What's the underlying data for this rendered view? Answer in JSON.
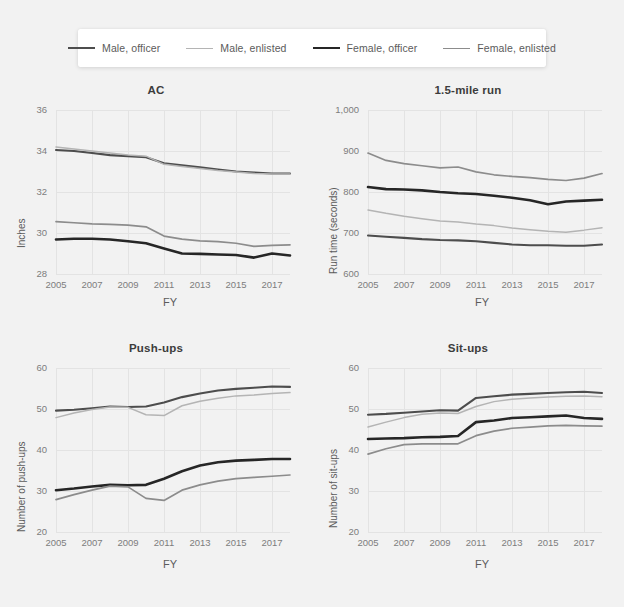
{
  "legend": {
    "entries": [
      {
        "label": "Male, officer",
        "color": "#4d4d4d",
        "width": 2.1,
        "key": "male_officer"
      },
      {
        "label": "Male, enlisted",
        "color": "#b4b4b4",
        "width": 1.5,
        "key": "male_enlisted"
      },
      {
        "label": "Female, officer",
        "color": "#262626",
        "width": 2.6,
        "key": "female_officer"
      },
      {
        "label": "Female, enlisted",
        "color": "#8c8c8c",
        "width": 1.7,
        "key": "female_enlisted"
      }
    ]
  },
  "chart_data": [
    {
      "id": "ac",
      "type": "line",
      "title": "AC",
      "xlabel": "FY",
      "ylabel": "Inches",
      "x": [
        2005,
        2006,
        2007,
        2008,
        2009,
        2010,
        2011,
        2012,
        2013,
        2014,
        2015,
        2016,
        2017,
        2018
      ],
      "xlim": [
        2005,
        2018
      ],
      "xticks": [
        2005,
        2007,
        2009,
        2011,
        2013,
        2015,
        2017
      ],
      "xticklabels": [
        "2005",
        "2007",
        "2009",
        "2011",
        "2013",
        "2015",
        "2017"
      ],
      "ylim": [
        28,
        36
      ],
      "yticks": [
        28,
        30,
        32,
        34,
        36
      ],
      "yticklabels": [
        "28",
        "30",
        "32",
        "34",
        "36"
      ],
      "grid": true,
      "series": [
        {
          "name": "Male, officer",
          "key": "male_officer",
          "values": [
            34.05,
            34.0,
            33.9,
            33.8,
            33.75,
            33.7,
            33.4,
            33.3,
            33.2,
            33.1,
            33.0,
            32.95,
            32.9,
            32.9
          ]
        },
        {
          "name": "Male, enlisted",
          "key": "male_enlisted",
          "values": [
            34.2,
            34.1,
            34.0,
            33.9,
            33.8,
            33.75,
            33.35,
            33.25,
            33.15,
            33.05,
            32.98,
            32.9,
            32.88,
            32.88
          ]
        },
        {
          "name": "Female, officer",
          "key": "female_officer",
          "values": [
            29.68,
            29.72,
            29.72,
            29.68,
            29.6,
            29.5,
            29.25,
            29.0,
            28.98,
            28.95,
            28.93,
            28.8,
            29.0,
            28.9
          ]
        },
        {
          "name": "Female, enlisted",
          "key": "female_enlisted",
          "values": [
            30.55,
            30.5,
            30.45,
            30.42,
            30.38,
            30.3,
            29.85,
            29.7,
            29.62,
            29.58,
            29.5,
            29.35,
            29.4,
            29.42
          ]
        }
      ]
    },
    {
      "id": "run",
      "type": "line",
      "title": "1.5-mile run",
      "xlabel": "FY",
      "ylabel": "Run time (seconds)",
      "x": [
        2005,
        2006,
        2007,
        2008,
        2009,
        2010,
        2011,
        2012,
        2013,
        2014,
        2015,
        2016,
        2017,
        2018
      ],
      "xlim": [
        2005,
        2018
      ],
      "xticks": [
        2005,
        2007,
        2009,
        2011,
        2013,
        2015,
        2017
      ],
      "xticklabels": [
        "2005",
        "2007",
        "2009",
        "2011",
        "2013",
        "2015",
        "2017"
      ],
      "ylim": [
        600,
        1000
      ],
      "yticks": [
        600,
        700,
        800,
        900,
        1000
      ],
      "yticklabels": [
        "600",
        "700",
        "800",
        "900",
        "1,000"
      ],
      "grid": true,
      "series": [
        {
          "name": "Male, officer",
          "key": "male_officer",
          "values": [
            694,
            691,
            688,
            685,
            683,
            682,
            680,
            676,
            672,
            670,
            670,
            669,
            669,
            672
          ]
        },
        {
          "name": "Male, enlisted",
          "key": "male_enlisted",
          "values": [
            756,
            748,
            741,
            735,
            729,
            727,
            722,
            718,
            712,
            708,
            704,
            702,
            707,
            713
          ]
        },
        {
          "name": "Female, officer",
          "key": "female_officer",
          "values": [
            812,
            807,
            806,
            804,
            800,
            797,
            795,
            791,
            786,
            780,
            770,
            777,
            779,
            781
          ]
        },
        {
          "name": "Female, enlisted",
          "key": "female_enlisted",
          "values": [
            895,
            877,
            869,
            864,
            859,
            861,
            849,
            842,
            838,
            835,
            831,
            828,
            834,
            845
          ]
        }
      ]
    },
    {
      "id": "pushups",
      "type": "line",
      "title": "Push-ups",
      "xlabel": "FY",
      "ylabel": "Number of push-ups",
      "x": [
        2005,
        2006,
        2007,
        2008,
        2009,
        2010,
        2011,
        2012,
        2013,
        2014,
        2015,
        2016,
        2017,
        2018
      ],
      "xlim": [
        2005,
        2018
      ],
      "xticks": [
        2005,
        2007,
        2009,
        2011,
        2013,
        2015,
        2017
      ],
      "xticklabels": [
        "2005",
        "2007",
        "2009",
        "2011",
        "2013",
        "2015",
        "2017"
      ],
      "ylim": [
        20,
        60
      ],
      "yticks": [
        20,
        30,
        40,
        50,
        60
      ],
      "yticklabels": [
        "20",
        "30",
        "40",
        "50",
        "60"
      ],
      "grid": true,
      "series": [
        {
          "name": "Male, officer",
          "key": "male_officer",
          "values": [
            49.6,
            49.8,
            50.2,
            50.6,
            50.5,
            50.6,
            51.6,
            52.9,
            53.8,
            54.5,
            54.9,
            55.2,
            55.5,
            55.4
          ]
        },
        {
          "name": "Male, enlisted",
          "key": "male_enlisted",
          "values": [
            47.9,
            49.0,
            49.9,
            50.5,
            50.4,
            48.6,
            48.4,
            50.8,
            51.9,
            52.6,
            53.2,
            53.4,
            53.8,
            54.0
          ]
        },
        {
          "name": "Female, officer",
          "key": "female_officer",
          "values": [
            30.2,
            30.6,
            31.1,
            31.5,
            31.4,
            31.5,
            33.0,
            34.8,
            36.2,
            37.0,
            37.4,
            37.6,
            37.8,
            37.8
          ]
        },
        {
          "name": "Female, enlisted",
          "key": "female_enlisted",
          "values": [
            27.9,
            29.1,
            30.2,
            31.2,
            31.0,
            28.2,
            27.7,
            30.2,
            31.5,
            32.4,
            33.0,
            33.3,
            33.6,
            33.9
          ]
        }
      ]
    },
    {
      "id": "situps",
      "type": "line",
      "title": "Sit-ups",
      "xlabel": "FY",
      "ylabel": "Number of sit-ups",
      "x": [
        2005,
        2006,
        2007,
        2008,
        2009,
        2010,
        2011,
        2012,
        2013,
        2014,
        2015,
        2016,
        2017,
        2018
      ],
      "xlim": [
        2005,
        2018
      ],
      "xticks": [
        2005,
        2007,
        2009,
        2011,
        2013,
        2015,
        2017
      ],
      "xticklabels": [
        "2005",
        "2007",
        "2009",
        "2011",
        "2013",
        "2015",
        "2017"
      ],
      "ylim": [
        20,
        60
      ],
      "yticks": [
        20,
        30,
        40,
        50,
        60
      ],
      "yticklabels": [
        "20",
        "30",
        "40",
        "50",
        "60"
      ],
      "grid": true,
      "series": [
        {
          "name": "Male, officer",
          "key": "male_officer",
          "values": [
            48.6,
            48.8,
            49.1,
            49.4,
            49.7,
            49.6,
            52.7,
            53.1,
            53.5,
            53.7,
            53.9,
            54.1,
            54.2,
            53.9
          ]
        },
        {
          "name": "Male, enlisted",
          "key": "male_enlisted",
          "values": [
            45.6,
            46.8,
            47.9,
            48.7,
            49.0,
            48.9,
            50.6,
            51.8,
            52.4,
            52.7,
            52.9,
            53.1,
            53.2,
            53.0
          ]
        },
        {
          "name": "Female, officer",
          "key": "female_officer",
          "values": [
            42.7,
            42.8,
            42.9,
            43.1,
            43.2,
            43.4,
            46.8,
            47.2,
            47.8,
            48.0,
            48.2,
            48.4,
            47.8,
            47.6
          ]
        },
        {
          "name": "Female, enlisted",
          "key": "female_enlisted",
          "values": [
            39.0,
            40.3,
            41.3,
            41.5,
            41.5,
            41.5,
            43.5,
            44.6,
            45.3,
            45.6,
            45.9,
            46.0,
            45.9,
            45.8
          ]
        }
      ]
    }
  ]
}
